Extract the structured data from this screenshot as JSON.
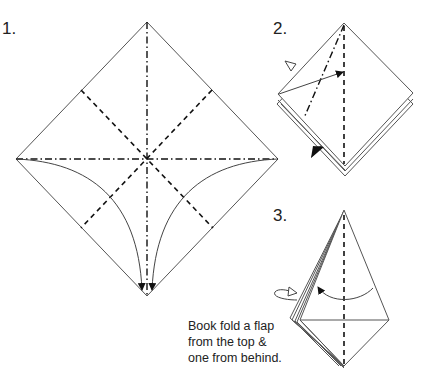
{
  "diagram": {
    "steps": [
      {
        "label": "1.",
        "description": "Square base preparation: valley fold diagonals, mountain fold center lines, collapse side corners down to the bottom point"
      },
      {
        "label": "2.",
        "description": "Fold the flap edge to the center line (front) and behind"
      },
      {
        "label": "3.",
        "description": "Book fold flaps",
        "note_lines": [
          "Book fold a flap",
          "from the top &",
          "one from behind."
        ]
      }
    ],
    "legend": {
      "valley_fold": "dashed line",
      "mountain_fold": "dash-dot line",
      "fold_behind_arrow": "open triangle head",
      "fold_front_arrow": "filled triangle head"
    }
  }
}
